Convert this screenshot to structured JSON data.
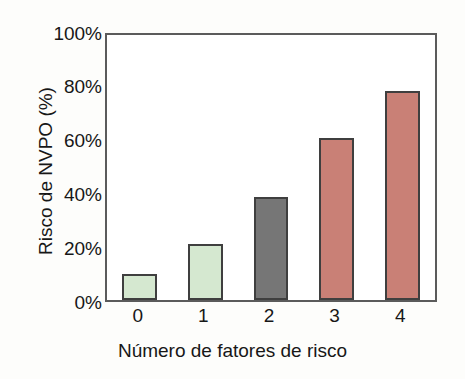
{
  "chart_data": {
    "type": "bar",
    "title": "",
    "subtitle": "",
    "xlabel": "Número de fatores de risco",
    "ylabel": "Risco de NVPO (%)",
    "categories": [
      "0",
      "1",
      "2",
      "3",
      "4"
    ],
    "values": [
      10,
      21,
      39,
      61,
      79
    ],
    "value_labels": [
      "10%",
      "21%",
      "39%",
      "61%",
      "79%"
    ],
    "ylim": [
      0,
      100
    ],
    "ytick_values": [
      0,
      20,
      40,
      60,
      80,
      100
    ],
    "ytick_labels": [
      "0%",
      "20%",
      "40%",
      "60%",
      "80%",
      "100%"
    ],
    "grid": false,
    "legend": null,
    "legend_position": "none",
    "annotations": [],
    "bar_colors": [
      "#d5e8d0",
      "#d5e8d0",
      "#767676",
      "#c98076",
      "#c98076"
    ],
    "bar_edge_colors": [
      "#3f3f3f",
      "#3f3f3f",
      "#3f3f3f",
      "#3f3f3f",
      "#3f3f3f"
    ]
  },
  "colors": {
    "green_fill": "#d5e8d0",
    "gray_fill": "#767676",
    "red_fill": "#c98076",
    "bar_outline": "#3f3f3f",
    "frame": "#5b5b5b",
    "text": "#171717",
    "page_background": "#fdfdfb",
    "plot_background": "#ffffff"
  }
}
